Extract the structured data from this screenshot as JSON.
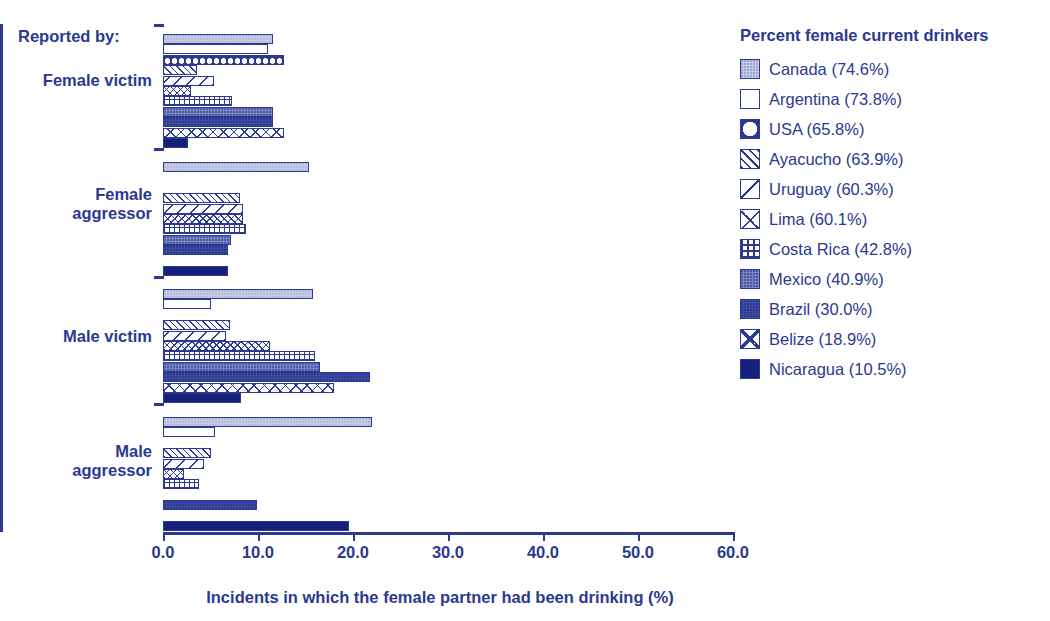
{
  "chart_data": {
    "type": "bar",
    "orientation": "horizontal",
    "title": "",
    "xlabel": "Incidents in which the female partner had been drinking (%)",
    "ylabel": "",
    "xlim": [
      0,
      60
    ],
    "xticks": [
      "0.0",
      "10.0",
      "20.0",
      "30.0",
      "40.0",
      "50.0",
      "60.0"
    ],
    "grid": false,
    "legend_position": "right",
    "legend_title": "Percent female current drinkers",
    "reported_by_label": "Reported by:",
    "categories": [
      "Female victim",
      "Female aggressor",
      "Male victim",
      "Male aggressor"
    ],
    "series": [
      {
        "name": "Canada (74.6%)",
        "country": "Canada",
        "pattern": "canada",
        "values": [
          11.6,
          15.4,
          15.8,
          22.0
        ]
      },
      {
        "name": "Argentina (73.8%)",
        "country": "Argentina",
        "pattern": "argentina",
        "values": [
          11.1,
          0.0,
          5.1,
          5.5
        ]
      },
      {
        "name": "USA (65.8%)",
        "country": "USA",
        "pattern": "usa",
        "values": [
          12.7,
          0.0,
          0.0,
          0.0
        ]
      },
      {
        "name": "Ayacucho (63.9%)",
        "country": "Ayacucho",
        "pattern": "ayacucho",
        "values": [
          3.6,
          8.1,
          7.0,
          5.0
        ]
      },
      {
        "name": "Uruguay (60.3%)",
        "country": "Uruguay",
        "pattern": "uruguay",
        "values": [
          5.4,
          8.4,
          6.6,
          4.3
        ]
      },
      {
        "name": "Lima (60.1%)",
        "country": "Lima",
        "pattern": "lima",
        "values": [
          2.9,
          8.4,
          11.3,
          2.2
        ]
      },
      {
        "name": "Costa Rica (42.8%)",
        "country": "Costa Rica",
        "pattern": "costarica",
        "values": [
          7.3,
          8.7,
          16.0,
          3.8
        ]
      },
      {
        "name": "Mexico (40.9%)",
        "country": "Mexico",
        "pattern": "mexico",
        "values": [
          11.6,
          7.2,
          16.5,
          0.0
        ]
      },
      {
        "name": "Brazil (30.0%)",
        "country": "Brazil",
        "pattern": "brazil",
        "values": [
          11.6,
          6.8,
          21.8,
          9.9
        ]
      },
      {
        "name": "Belize (18.9%)",
        "country": "Belize",
        "pattern": "belize",
        "values": [
          12.7,
          0.0,
          18.0,
          0.0
        ]
      },
      {
        "name": "Nicaragua (10.5%)",
        "country": "Nicaragua",
        "pattern": "nicaragua",
        "values": [
          2.6,
          6.8,
          8.2,
          19.6
        ]
      }
    ]
  },
  "legend": {
    "title": "Percent female current drinkers",
    "items": [
      {
        "label": "Canada (74.6%)",
        "swatch": "canada"
      },
      {
        "label": "Argentina (73.8%)",
        "swatch": "argentina"
      },
      {
        "label": "USA (65.8%)",
        "swatch": "usa"
      },
      {
        "label": "Ayacucho (63.9%)",
        "swatch": "ayacucho"
      },
      {
        "label": "Uruguay (60.3%)",
        "swatch": "uruguay"
      },
      {
        "label": "Lima (60.1%)",
        "swatch": "lima"
      },
      {
        "label": "Costa Rica (42.8%)",
        "swatch": "costarica"
      },
      {
        "label": "Mexico (40.9%)",
        "swatch": "mexico"
      },
      {
        "label": "Brazil (30.0%)",
        "swatch": "brazil"
      },
      {
        "label": "Belize (18.9%)",
        "swatch": "belize"
      },
      {
        "label": "Nicaragua (10.5%)",
        "swatch": "nicaragua"
      }
    ]
  },
  "axis": {
    "reported_by": "Reported by:",
    "groups": [
      "Female victim",
      "Female\naggressor",
      "Male victim",
      "Male\naggressor"
    ],
    "x_title": "Incidents in which the female partner had been drinking (%)",
    "x_ticks": [
      "0.0",
      "10.0",
      "20.0",
      "30.0",
      "40.0",
      "50.0",
      "60.0"
    ]
  },
  "colors": {
    "primary": "#2b3990",
    "dark": "#15207a",
    "light_fill": "#c8cde4",
    "mid_fill": "#7b86c2",
    "background": "#ffffff"
  }
}
